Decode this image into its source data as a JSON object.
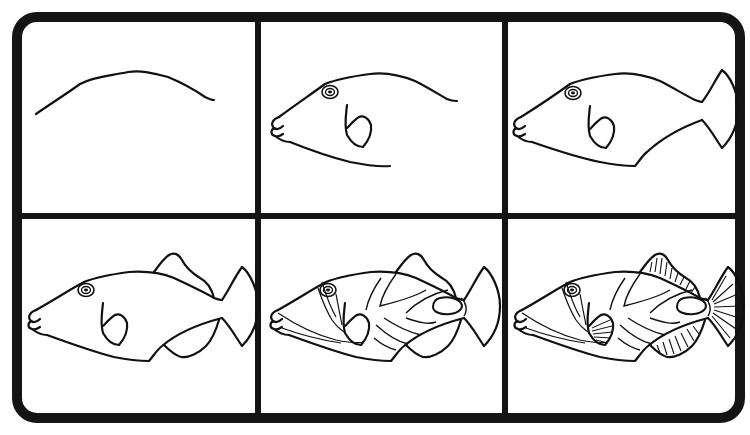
{
  "colors": {
    "background": "#ffffff",
    "ink": "#111111",
    "frame": "#141414"
  },
  "grid": {
    "rows": 2,
    "cols": 3
  },
  "panels": [
    {
      "step": 1,
      "label": "Step 1",
      "description": "Curved back line"
    },
    {
      "step": 2,
      "label": "Step 2",
      "description": "Head, mouth, eye, belly line and pectoral fin"
    },
    {
      "step": 3,
      "label": "Step 3",
      "description": "Body closed with tail fin"
    },
    {
      "step": 4,
      "label": "Step 4",
      "description": "Dorsal and anal fins added"
    },
    {
      "step": 5,
      "label": "Step 5",
      "description": "Body stripes, face lines and tail spot"
    },
    {
      "step": 6,
      "label": "Step 6",
      "description": "Fin rays detailed"
    }
  ]
}
